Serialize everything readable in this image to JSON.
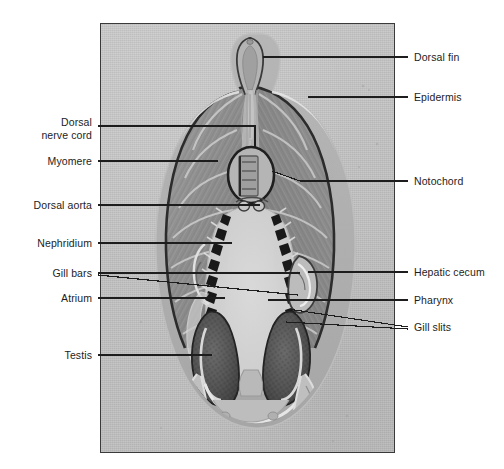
{
  "figure": {
    "type": "labeled-photomicrograph",
    "plate": {
      "background_color": "#c3c3c3",
      "border_color": "#3a3a3a",
      "left": 100,
      "top": 23,
      "width": 295,
      "height": 430
    },
    "text_color": "#1d1d1d",
    "leader_color": "#1d1d1d"
  },
  "labels": {
    "left": [
      {
        "id": "dorsal-nerve-cord",
        "lines": [
          "Dorsal",
          "nerve cord"
        ],
        "text": "Dorsal nerve cord",
        "text_right": 92,
        "text_top": 116,
        "leader": [
          [
            98,
            126
          ],
          [
            255,
            126
          ],
          [
            255,
            148
          ]
        ]
      },
      {
        "id": "myomere",
        "lines": [
          "Myomere"
        ],
        "text": "Myomere",
        "text_right": 92,
        "text_top": 155,
        "leader": [
          [
            98,
            161
          ],
          [
            218,
            161
          ]
        ]
      },
      {
        "id": "dorsal-aorta",
        "lines": [
          "Dorsal aorta"
        ],
        "text": "Dorsal aorta",
        "text_right": 92,
        "text_top": 199,
        "leader": [
          [
            98,
            205
          ],
          [
            260,
            205
          ]
        ]
      },
      {
        "id": "nephridium",
        "lines": [
          "Nephridium"
        ],
        "text": "Nephridium",
        "text_right": 92,
        "text_top": 237,
        "leader": [
          [
            98,
            243
          ],
          [
            232,
            243
          ]
        ]
      },
      {
        "id": "gill-bars",
        "lines": [
          "Gill bars"
        ],
        "text": "Gill bars",
        "text_right": 92,
        "text_top": 267,
        "leader": [
          [
            98,
            273
          ],
          [
            300,
            273
          ]
        ],
        "leader2": [
          [
            98,
            275
          ],
          [
            298,
            295
          ]
        ]
      },
      {
        "id": "atrium",
        "lines": [
          "Atrium"
        ],
        "text": "Atrium",
        "text_right": 92,
        "text_top": 292,
        "leader": [
          [
            98,
            298
          ],
          [
            225,
            298
          ]
        ]
      },
      {
        "id": "testis",
        "lines": [
          "Testis"
        ],
        "text": "Testis",
        "text_right": 92,
        "text_top": 349,
        "leader": [
          [
            98,
            355
          ],
          [
            212,
            355
          ]
        ]
      }
    ],
    "right": [
      {
        "id": "dorsal-fin",
        "lines": [
          "Dorsal fin"
        ],
        "text": "Dorsal fin",
        "text_left": 414,
        "text_top": 51,
        "leader": [
          [
            408,
            57
          ],
          [
            263,
            57
          ]
        ]
      },
      {
        "id": "epidermis",
        "lines": [
          "Epidermis"
        ],
        "text": "Epidermis",
        "text_left": 414,
        "text_top": 91,
        "leader": [
          [
            408,
            97
          ],
          [
            308,
            97
          ]
        ]
      },
      {
        "id": "notochord",
        "lines": [
          "Notochord"
        ],
        "text": "Notochord",
        "text_left": 414,
        "text_top": 175,
        "leader": [
          [
            408,
            181
          ],
          [
            300,
            181
          ],
          [
            272,
            171
          ]
        ]
      },
      {
        "id": "hepatic-cecum",
        "lines": [
          "Hepatic cecum"
        ],
        "text": "Hepatic cecum",
        "text_left": 414,
        "text_top": 266,
        "leader": [
          [
            408,
            272
          ],
          [
            308,
            272
          ]
        ]
      },
      {
        "id": "pharynx",
        "lines": [
          "Pharynx"
        ],
        "text": "Pharynx",
        "text_left": 414,
        "text_top": 294,
        "leader": [
          [
            408,
            300
          ],
          [
            268,
            300
          ]
        ]
      },
      {
        "id": "gill-slits",
        "lines": [
          "Gill slits"
        ],
        "text": "Gill slits",
        "text_left": 414,
        "text_top": 321,
        "leader": [
          [
            408,
            327
          ],
          [
            288,
            309
          ]
        ],
        "leader2": [
          [
            408,
            329
          ],
          [
            286,
            322
          ]
        ]
      }
    ]
  },
  "anatomy_notes": {
    "structures": [
      "Dorsal fin",
      "Epidermis",
      "Dorsal nerve cord",
      "Myomere",
      "Notochord",
      "Dorsal aorta",
      "Nephridium",
      "Gill bars",
      "Hepatic cecum",
      "Atrium",
      "Pharynx",
      "Gill slits",
      "Testis"
    ]
  }
}
